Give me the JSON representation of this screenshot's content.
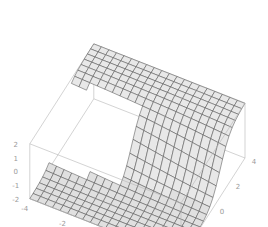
{
  "chart_data": {
    "type": "surface3d",
    "title": "",
    "xlabel": "",
    "ylabel": "",
    "zlabel": "",
    "x_range": [
      -4,
      4
    ],
    "y_range": [
      -4,
      4
    ],
    "z_range": [
      -2,
      2
    ],
    "x_ticks": [
      "-4",
      "-2",
      "0",
      "2",
      "4"
    ],
    "y_ticks": [
      "-4",
      "-2",
      "0",
      "2",
      "4"
    ],
    "z_ticks": [
      "-2",
      "-1",
      "0",
      "1",
      "2"
    ],
    "grid_lines": 21,
    "surface_description": "Sheet with a lower plane (z≈-2) and an upper plane (z≈2) connected by a curved fold; the upper sheet is cut away where x<0 and y<0, exposing a gap (Riemann-surface-like branch cut).",
    "mesh_color": "#555555",
    "face_color": "#e6e6e6",
    "box_color": "#b5b5b5"
  },
  "axes": {
    "x_labels": [
      "-4",
      "-2",
      "0",
      "2",
      "4"
    ],
    "y_labels": [
      "-4",
      "-2",
      "0",
      "2",
      "4"
    ],
    "z_labels": [
      "2",
      "1",
      "0",
      "-1",
      "-2"
    ]
  }
}
